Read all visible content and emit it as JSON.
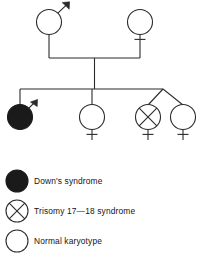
{
  "figure": {
    "type": "pedigree-diagram"
  },
  "colors": {
    "line": "#2b2b2b",
    "affected_fill": "#1a1a1a",
    "unaffected_fill": "#ffffff",
    "text": "#141414",
    "background": "#ffffff"
  },
  "pedigree": {
    "generations": [
      {
        "id": "generation-1",
        "label": "Parents",
        "individuals": [
          {
            "id": "father",
            "sex": "male",
            "sex_symbol": "mars-symbol",
            "status": "normal-karyotype",
            "filled": false,
            "marker": "none"
          },
          {
            "id": "mother",
            "sex": "female",
            "sex_symbol": "venus-symbol",
            "status": "normal-karyotype",
            "filled": false,
            "marker": "none"
          }
        ]
      },
      {
        "id": "generation-2",
        "label": "Offspring",
        "individuals": [
          {
            "id": "child-1",
            "sex": "male",
            "sex_symbol": "mars-symbol",
            "status": "downs-syndrome",
            "filled": true,
            "marker": "none"
          },
          {
            "id": "child-2",
            "sex": "female",
            "sex_symbol": "venus-symbol",
            "status": "normal-karyotype",
            "filled": false,
            "marker": "none"
          },
          {
            "id": "child-3-twin-a",
            "sex": "female",
            "sex_symbol": "venus-symbol",
            "status": "trisomy-17-18-syndrome",
            "filled": false,
            "marker": "cross-inside",
            "twin_group": "twins"
          },
          {
            "id": "child-4-twin-b",
            "sex": "female",
            "sex_symbol": "venus-symbol",
            "status": "normal-karyotype",
            "filled": false,
            "marker": "none",
            "twin_group": "twins"
          }
        ]
      }
    ]
  },
  "legend": {
    "items": [
      {
        "symbol": "filled-circle",
        "label": "Down's syndrome"
      },
      {
        "symbol": "circle-with-cross",
        "label": "Trisomy 17—18 syndrome"
      },
      {
        "symbol": "open-circle",
        "label": "Normal karyotype"
      }
    ]
  }
}
